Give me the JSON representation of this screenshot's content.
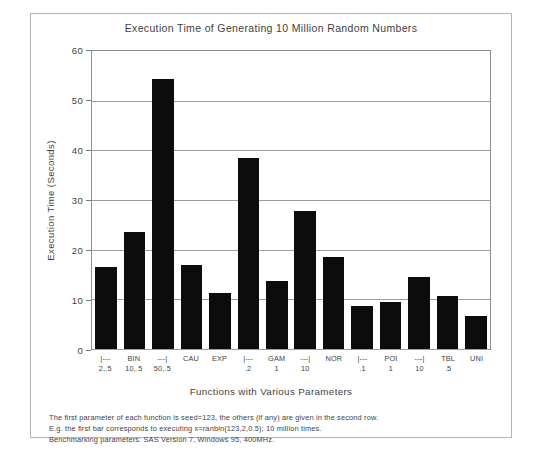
{
  "chart_data": {
    "type": "bar",
    "title": "Execution Time of Generating 10 Million Random Numbers",
    "xlabel": "Functions with Various Parameters",
    "ylabel": "Execution Time (Seconds)",
    "ylim": [
      0,
      60
    ],
    "yticks": [
      0,
      10,
      20,
      30,
      40,
      50,
      60
    ],
    "grid": true,
    "legend": "none",
    "categories": [
      "BIN 2,.5",
      "BIN 10,.5",
      "BIN 50,.5",
      "CAU",
      "EXP",
      "GAM .2",
      "GAM 1",
      "GAM 10",
      "NOR",
      "POI .1",
      "POI 1",
      "POI 10",
      "TBL .5",
      "UNI"
    ],
    "values": [
      16.5,
      23.5,
      54.3,
      17.0,
      11.3,
      38.5,
      13.7,
      27.8,
      18.5,
      8.7,
      9.5,
      14.4,
      10.7,
      6.6
    ],
    "bar_color": "#0c0c0c",
    "tick_labels": [
      {
        "top": "|---",
        "bottom": "2,.5"
      },
      {
        "top": "BIN",
        "bottom": "10,.5"
      },
      {
        "top": "---|",
        "bottom": "50,.5"
      },
      {
        "top": "CAU",
        "bottom": ""
      },
      {
        "top": "EXP",
        "bottom": ""
      },
      {
        "top": "|---",
        "bottom": ".2"
      },
      {
        "top": "GAM",
        "bottom": "1"
      },
      {
        "top": "---|",
        "bottom": "10"
      },
      {
        "top": "NOR",
        "bottom": ""
      },
      {
        "top": "|---",
        "bottom": ".1"
      },
      {
        "top": "POI",
        "bottom": "1"
      },
      {
        "top": "---|",
        "bottom": "10"
      },
      {
        "top": "TBL",
        "bottom": ".5"
      },
      {
        "top": "UNI",
        "bottom": ""
      }
    ]
  },
  "footnote": {
    "line1": "The first parameter of each function is seed=123, the others (if any) are given in the second row.",
    "line2": "E.g. the first bar corresponds to executing  x=ranbin(123,2,0.5);  10 million times.",
    "line3": "Benchmarking parameters: SAS Version 7, Windows 95, 400MHz."
  }
}
